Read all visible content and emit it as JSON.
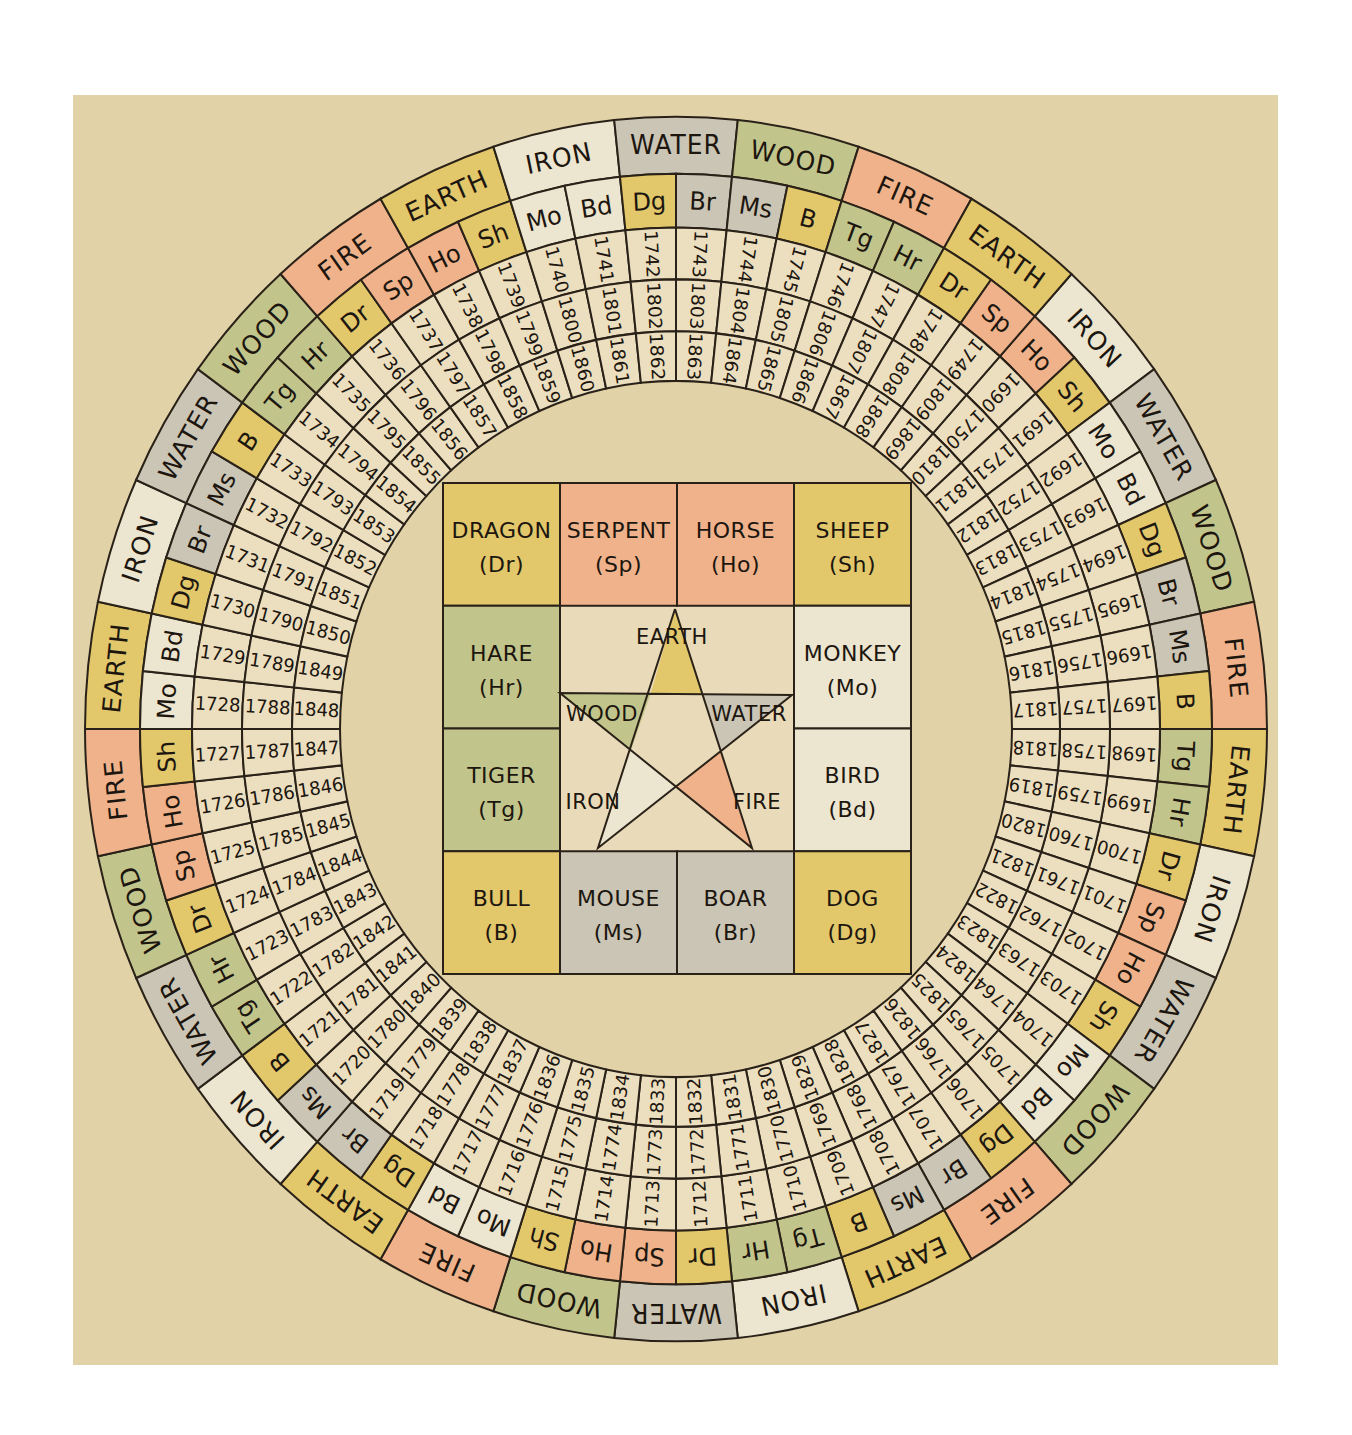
{
  "panel": {
    "x": 73,
    "y": 95,
    "width": 1205,
    "height": 1270,
    "color": "#e2d2a8"
  },
  "colors": {
    "IRON": "#ece5cf",
    "WATER": "#cbc5b5",
    "WOOD": "#c2c58b",
    "FIRE": "#efb28b",
    "EARTH": "#e2c76b",
    "year_cell": "#ecdfc0",
    "center_field": "#e9dbb9",
    "ink": "#2a2218"
  },
  "animal_element_color": {
    "Dr": "EARTH",
    "Sp": "FIRE",
    "Ho": "FIRE",
    "Sh": "EARTH",
    "Hr": "WOOD",
    "Tg": "WOOD",
    "Mo": "IRON",
    "Bd": "IRON",
    "B": "EARTH",
    "Ms": "WATER",
    "Br": "WATER",
    "Dg": "EARTH"
  },
  "wheel": {
    "center": [
      676,
      729
    ],
    "y_scale": 1.036,
    "radii": {
      "outer": 591,
      "element_inner": 536,
      "animal_inner": 484,
      "year_ring1_inner": 434,
      "year_ring2_inner": 384,
      "inner": 336
    },
    "start_angle_deg": 42,
    "cell_angle_deg": 6,
    "elements": [
      "IRON",
      "WATER",
      "WOOD",
      "FIRE",
      "EARTH",
      "IRON",
      "WATER",
      "WOOD",
      "FIRE",
      "EARTH",
      "IRON",
      "WATER",
      "WOOD",
      "FIRE",
      "EARTH",
      "IRON",
      "WATER",
      "WOOD",
      "FIRE",
      "EARTH",
      "IRON",
      "WATER",
      "WOOD",
      "FIRE",
      "EARTH",
      "IRON",
      "WATER",
      "WOOD",
      "FIRE",
      "EARTH"
    ],
    "animals": [
      "Ho",
      "Sh",
      "Mo",
      "Bd",
      "Dg",
      "Br",
      "Ms",
      "B",
      "Tg",
      "Hr",
      "Dr",
      "Sp",
      "Ho",
      "Sh",
      "Mo",
      "Bd",
      "Dg",
      "Br",
      "Ms",
      "B",
      "Tg",
      "Hr",
      "Dr",
      "Sp",
      "Ho",
      "Sh",
      "Mo",
      "Bd",
      "Dg",
      "Br",
      "Ms",
      "B",
      "Tg",
      "Hr",
      "Dr",
      "Sp",
      "Ho",
      "Sh",
      "Mo",
      "Bd",
      "Dg",
      "Br",
      "Ms",
      "B",
      "Tg",
      "Hr",
      "Dr",
      "Sp",
      "Ho",
      "Sh",
      "Mo",
      "Bd",
      "Dg",
      "Br",
      "Ms",
      "B",
      "Tg",
      "Hr",
      "Dr",
      "Sp"
    ],
    "years_outer": [
      "1690",
      "1691",
      "1692",
      "1693",
      "1694",
      "1695",
      "1696",
      "1697",
      "1698",
      "1699",
      "1700",
      "1701",
      "1702",
      "1703",
      "1704",
      "1705",
      "1706",
      "1707",
      "1708",
      "1709",
      "1710",
      "1711",
      "1712",
      "1713",
      "1714",
      "1715",
      "1716",
      "1717",
      "1718",
      "1719",
      "1720",
      "1721",
      "1722",
      "1723",
      "1724",
      "1725",
      "1726",
      "1727",
      "1728",
      "1729",
      "1730",
      "1731",
      "1732",
      "1733",
      "1734",
      "1735",
      "1736",
      "1737",
      "1738",
      "1739",
      "1740",
      "1741",
      "1742",
      "1743",
      "1744",
      "1745",
      "1746",
      "1747",
      "1748",
      "1749"
    ],
    "years_middle": [
      "1750",
      "1751",
      "1752",
      "1753",
      "1754",
      "1755",
      "1756",
      "1757",
      "1758",
      "1759",
      "1760",
      "1761",
      "1762",
      "1763",
      "1764",
      "1765",
      "1766",
      "1767",
      "1768",
      "1769",
      "1770",
      "1771",
      "1772",
      "1773",
      "1774",
      "1775",
      "1776",
      "1777",
      "1778",
      "1779",
      "1780",
      "1781",
      "1782",
      "1783",
      "1784",
      "1785",
      "1786",
      "1787",
      "1788",
      "1789",
      "1790",
      "1791",
      "1792",
      "1793",
      "1794",
      "1795",
      "1796",
      "1797",
      "1798",
      "1799",
      "1800",
      "1801",
      "1802",
      "1803",
      "1804",
      "1805",
      "1806",
      "1807",
      "1808",
      "1809"
    ],
    "years_inner": [
      "1810",
      "1811",
      "1812",
      "1813",
      "1814",
      "1815",
      "1816",
      "1817",
      "1818",
      "1819",
      "1820",
      "1821",
      "1822",
      "1823",
      "1824",
      "1825",
      "1826",
      "1827",
      "1828",
      "1829",
      "1830",
      "1831",
      "1832",
      "1833",
      "1834",
      "1835",
      "1836",
      "1837",
      "1838",
      "1839",
      "1840",
      "1841",
      "1842",
      "1843",
      "1844",
      "1845",
      "1846",
      "1847",
      "1848",
      "1849",
      "1850",
      "1851",
      "1852",
      "1853",
      "1854",
      "1855",
      "1856",
      "1857",
      "1858",
      "1859",
      "1860",
      "1861",
      "1862",
      "1863",
      "1864",
      "1865",
      "1866",
      "1867",
      "1868",
      "1869"
    ]
  },
  "center_square": {
    "x": 443,
    "y": 483,
    "width": 468,
    "height": 491,
    "cells": [
      {
        "row": 0,
        "col": 0,
        "name": "DRAGON",
        "abbr": "(Dr)",
        "element": "EARTH"
      },
      {
        "row": 0,
        "col": 1,
        "name": "SERPENT",
        "abbr": "(Sp)",
        "element": "FIRE"
      },
      {
        "row": 0,
        "col": 2,
        "name": "HORSE",
        "abbr": "(Ho)",
        "element": "FIRE"
      },
      {
        "row": 0,
        "col": 3,
        "name": "SHEEP",
        "abbr": "(Sh)",
        "element": "EARTH"
      },
      {
        "row": 1,
        "col": 0,
        "name": "HARE",
        "abbr": "(Hr)",
        "element": "WOOD"
      },
      {
        "row": 2,
        "col": 0,
        "name": "TIGER",
        "abbr": "(Tg)",
        "element": "WOOD"
      },
      {
        "row": 1,
        "col": 3,
        "name": "MONKEY",
        "abbr": "(Mo)",
        "element": "IRON"
      },
      {
        "row": 2,
        "col": 3,
        "name": "BIRD",
        "abbr": "(Bd)",
        "element": "IRON"
      },
      {
        "row": 3,
        "col": 0,
        "name": "BULL",
        "abbr": "(B)",
        "element": "EARTH"
      },
      {
        "row": 3,
        "col": 1,
        "name": "MOUSE",
        "abbr": "(Ms)",
        "element": "WATER"
      },
      {
        "row": 3,
        "col": 2,
        "name": "BOAR",
        "abbr": "(Br)",
        "element": "WATER"
      },
      {
        "row": 3,
        "col": 3,
        "name": "DOG",
        "abbr": "(Dg)",
        "element": "EARTH"
      }
    ]
  },
  "pentagram": {
    "points": {
      "apex": [
        675,
        609
      ],
      "left": [
        560,
        693
      ],
      "right": [
        792,
        695
      ],
      "bottom_left": [
        598,
        848
      ],
      "bottom_right": [
        752,
        848
      ]
    },
    "regions": [
      {
        "label": "EARTH",
        "element": "EARTH",
        "poly": [
          [
            675,
            609
          ],
          [
            651,
            693
          ],
          [
            702,
            694
          ]
        ],
        "label_pos": [
          672,
          637
        ]
      },
      {
        "label": "WOOD",
        "element": "WOOD",
        "poly": [
          [
            560,
            693
          ],
          [
            651,
            693
          ],
          [
            631,
            750
          ]
        ],
        "label_pos": [
          602,
          714
        ]
      },
      {
        "label": "WATER",
        "element": "WATER",
        "poly": [
          [
            792,
            695
          ],
          [
            702,
            694
          ],
          [
            721,
            751
          ]
        ],
        "label_pos": [
          749,
          714
        ]
      },
      {
        "label": "IRON",
        "element": "IRON",
        "poly": [
          [
            598,
            848
          ],
          [
            631,
            750
          ],
          [
            676,
            788
          ]
        ],
        "label_pos": [
          593,
          802
        ]
      },
      {
        "label": "FIRE",
        "element": "FIRE",
        "poly": [
          [
            752,
            848
          ],
          [
            721,
            751
          ],
          [
            676,
            788
          ]
        ],
        "label_pos": [
          757,
          802
        ]
      }
    ]
  }
}
